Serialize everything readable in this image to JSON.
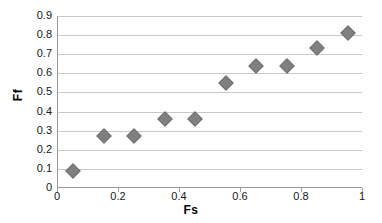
{
  "chart_data": {
    "type": "scatter",
    "title": "",
    "xlabel": "Fs",
    "ylabel": "Ff",
    "xlim": [
      0,
      1
    ],
    "ylim": [
      0,
      0.9
    ],
    "grid": true,
    "legend": false,
    "marker": {
      "shape": "diamond",
      "color": "#808080",
      "edge_color": "#707070",
      "size_px": 11
    },
    "x_ticks": [
      0,
      0.2,
      0.4,
      0.6,
      0.8,
      1
    ],
    "x_tick_labels": [
      "0",
      "0.2",
      "0.4",
      "0.6",
      "0.8",
      "1"
    ],
    "y_ticks": [
      0,
      0.1,
      0.2,
      0.3,
      0.4,
      0.5,
      0.6,
      0.7,
      0.8,
      0.9
    ],
    "y_tick_labels": [
      "0",
      "0.1",
      "0.2",
      "0.3",
      "0.4",
      "0.5",
      "0.6",
      "0.7",
      "0.8",
      "0.9"
    ],
    "x": [
      0.05,
      0.15,
      0.25,
      0.35,
      0.45,
      0.55,
      0.65,
      0.75,
      0.85,
      0.95
    ],
    "y": [
      0.09,
      0.27,
      0.27,
      0.36,
      0.36,
      0.55,
      0.64,
      0.64,
      0.73,
      0.81
    ],
    "points": [
      {
        "x": 0.05,
        "y": 0.09
      },
      {
        "x": 0.15,
        "y": 0.27
      },
      {
        "x": 0.25,
        "y": 0.27
      },
      {
        "x": 0.35,
        "y": 0.36
      },
      {
        "x": 0.45,
        "y": 0.36
      },
      {
        "x": 0.55,
        "y": 0.55
      },
      {
        "x": 0.65,
        "y": 0.64
      },
      {
        "x": 0.75,
        "y": 0.64
      },
      {
        "x": 0.85,
        "y": 0.73
      },
      {
        "x": 0.95,
        "y": 0.81
      }
    ]
  },
  "axes": {
    "x_title": "Fs",
    "y_title": "Ff"
  },
  "colors": {
    "marker": "#808080",
    "gridline": "#c8c8c8",
    "axis": "#9a9a9a",
    "text": "#181818",
    "background": "#ffffff"
  }
}
